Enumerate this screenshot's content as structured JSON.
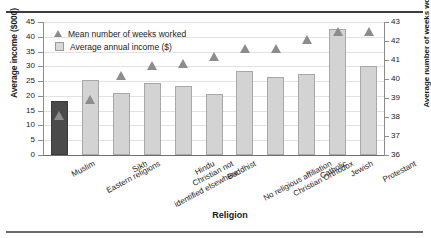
{
  "figure": {
    "top_caption": "",
    "xtitle": "Religion",
    "ytitle_left": "Average income ($000)",
    "ytitle_right": "Average number of weeks worked"
  },
  "legend": {
    "items": [
      {
        "label": "Mean number of weeks worked",
        "marker": "triangle-marker",
        "color": "#8c8c8c"
      },
      {
        "label": "Average annual income ($)",
        "marker": "square-marker",
        "color": "#d9d9d9"
      }
    ]
  },
  "chart_data": {
    "type": "bar",
    "title": "",
    "xlabel": "Religion",
    "ylabel": "Average income ($000)",
    "y2label": "Average number of weeks worked",
    "ylim": [
      0,
      45
    ],
    "y2lim": [
      36,
      43
    ],
    "yticks": [
      0,
      5,
      10,
      15,
      20,
      25,
      30,
      35,
      40,
      45
    ],
    "y2ticks": [
      36,
      37,
      38,
      39,
      40,
      41,
      42,
      43
    ],
    "grid": true,
    "legend_position": "top-left",
    "categories": [
      "Muslim",
      "Eastern religions",
      "Sikh",
      "Christian not identified elsewhere",
      "Hindu",
      "Buddhist",
      "No religious affiliation",
      "Christian Orthodox",
      "Catholic",
      "Jewish",
      "Protestant"
    ],
    "category_lines": [
      [
        "Muslim"
      ],
      [
        "Eastern religions"
      ],
      [
        "Sikh"
      ],
      [
        "Christian not",
        "identified elsewhere"
      ],
      [
        "Hindu"
      ],
      [
        "Buddhist"
      ],
      [
        "No religious affiliation"
      ],
      [
        "Christian Orthodox"
      ],
      [
        "Catholic"
      ],
      [
        "Jewish"
      ],
      [
        "Protestant"
      ]
    ],
    "series": [
      {
        "name": "Average annual income ($)",
        "type": "bar",
        "axis": "left",
        "color": "#d3d3d3",
        "highlight_index": 0,
        "highlight_color": "#4a4a4a",
        "values": [
          18.4,
          25.5,
          21.0,
          24.3,
          23.4,
          20.7,
          28.4,
          26.4,
          27.4,
          42.5,
          30.0
        ]
      },
      {
        "name": "Mean number of weeks worked",
        "type": "scatter",
        "axis": "right",
        "color": "#8c8c8c",
        "marker": "triangle",
        "values": [
          38.1,
          38.9,
          40.2,
          40.7,
          40.8,
          41.2,
          41.6,
          41.6,
          42.1,
          42.5,
          42.5
        ]
      }
    ]
  }
}
